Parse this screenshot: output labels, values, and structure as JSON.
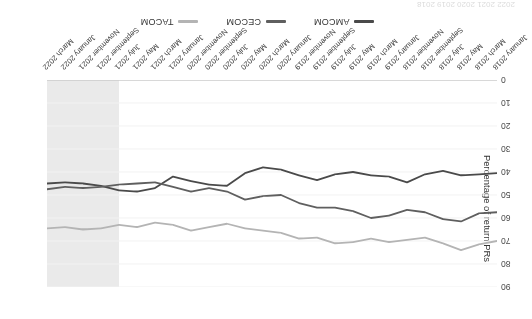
{
  "figure": {
    "rotation_note": "rendered-180-degrees",
    "background": "#ffffff"
  },
  "axis": {
    "y_title": "Percentage of return PRs",
    "y_ticks": [
      "0",
      "10",
      "20",
      "30",
      "40",
      "50",
      "60",
      "70",
      "80",
      "90"
    ]
  },
  "legend": {
    "items": [
      {
        "label": "AMCOM",
        "color": "#4a4a4a"
      },
      {
        "label": "CECOM",
        "color": "#5f5f5f"
      },
      {
        "label": "TACOM",
        "color": "#b4b4b4"
      }
    ]
  },
  "clipped_text": "2022   2021   2020   2019   2018",
  "chart_data": {
    "type": "line",
    "title": "",
    "xlabel": "",
    "ylabel": "Percentage of return PRs",
    "ylim": [
      0,
      90
    ],
    "grid": true,
    "legend_position": "bottom",
    "highlight_band": {
      "from": "July 2021",
      "to": "March 2022",
      "color": "#e6e6e6"
    },
    "categories": [
      "January 2018",
      "March 2018",
      "May 2018",
      "July 2018",
      "September 2018",
      "November 2018",
      "January 2019",
      "March 2019",
      "May 2019",
      "July 2019",
      "September 2019",
      "November 2019",
      "January 2020",
      "March 2020",
      "May 2020",
      "July 2020",
      "September 2020",
      "November 2020",
      "January 2021",
      "March 2021",
      "May 2021",
      "July 2021",
      "September 2021",
      "November 2021",
      "January 2022",
      "March 2022"
    ],
    "series": [
      {
        "name": "AMCOM",
        "color": "#4a4a4a",
        "values": [
          40.5,
          41.0,
          41.5,
          39.5,
          41.0,
          44.5,
          42.0,
          41.5,
          40.0,
          41.0,
          43.5,
          41.5,
          39.0,
          38.0,
          40.5,
          46.0,
          45.5,
          44.0,
          42.0,
          47.0,
          48.5,
          48.0,
          46.0,
          45.0,
          44.5,
          45.0
        ]
      },
      {
        "name": "CECOM",
        "color": "#5f5f5f",
        "values": [
          57.5,
          58.0,
          61.5,
          60.5,
          57.5,
          56.5,
          59.0,
          60.0,
          57.0,
          55.5,
          55.5,
          53.5,
          50.0,
          50.5,
          52.0,
          48.5,
          47.0,
          48.5,
          46.5,
          44.5,
          45.0,
          45.5,
          46.5,
          47.0,
          46.5,
          47.5
        ]
      },
      {
        "name": "TACOM",
        "color": "#b4b4b4",
        "values": [
          70.0,
          71.5,
          74.0,
          71.0,
          68.5,
          69.5,
          70.5,
          69.0,
          70.5,
          71.0,
          68.5,
          69.0,
          66.5,
          65.5,
          64.5,
          62.5,
          64.0,
          65.5,
          63.0,
          62.0,
          64.0,
          63.0,
          64.5,
          65.0,
          64.0,
          64.5
        ]
      }
    ]
  }
}
